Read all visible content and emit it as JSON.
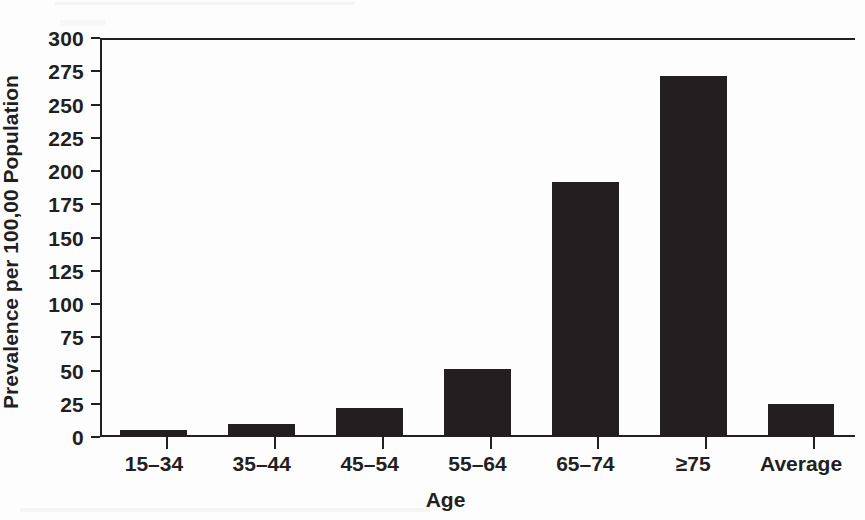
{
  "chart_data": {
    "type": "bar",
    "title": "",
    "xlabel": "Age",
    "ylabel": "Prevalence per 100,00 Population",
    "categories": [
      "15–34",
      "35–44",
      "45–54",
      "55–64",
      "65–74",
      "≥75",
      "Average"
    ],
    "values": [
      4,
      8,
      20,
      50,
      190,
      270,
      23
    ],
    "ylim": [
      0,
      300
    ],
    "yticks": [
      0,
      25,
      50,
      75,
      100,
      125,
      150,
      175,
      200,
      225,
      250,
      275,
      300
    ],
    "ytick_labels": [
      "0",
      "25",
      "50",
      "75",
      "100",
      "125",
      "150",
      "175",
      "200",
      "225",
      "250",
      "275",
      "300"
    ],
    "grid": false,
    "legend": null,
    "bar_color": "#231f20",
    "axis_color": "#231f20",
    "background": "#ffffff",
    "series": [
      {
        "name": "Prevalence per 100,00 Population",
        "values": [
          4,
          8,
          20,
          50,
          190,
          270,
          23
        ]
      }
    ]
  }
}
